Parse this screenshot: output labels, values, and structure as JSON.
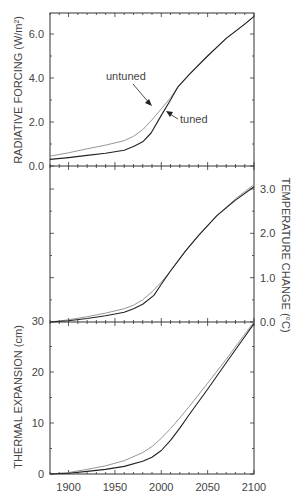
{
  "chart_data": [
    {
      "type": "line",
      "panel": "top",
      "ylabel": "RADIATIVE FORCING (W/m²)",
      "ylabel_side": "left",
      "ylim": [
        0,
        7
      ],
      "yticks": [
        0,
        2,
        4,
        6
      ],
      "ytick_labels": [
        "0.0",
        "2.0",
        "4.0",
        "6.0"
      ],
      "xlim": [
        1880,
        2100
      ],
      "annotations": [
        {
          "text": "untuned",
          "x": 1985,
          "y": 4.1,
          "arrow_to": [
            2005,
            3.1
          ]
        },
        {
          "text": "tuned",
          "x": 2033,
          "y": 2.2,
          "arrow_to": [
            2014,
            2.8
          ]
        }
      ],
      "series": [
        {
          "name": "untuned",
          "color": "#8a8a8a",
          "x": [
            1880,
            1900,
            1920,
            1940,
            1960,
            1970,
            1980,
            1990,
            2000,
            2010,
            2018,
            2030,
            2050,
            2070,
            2090,
            2100
          ],
          "y": [
            0.45,
            0.6,
            0.78,
            0.95,
            1.15,
            1.35,
            1.65,
            2.1,
            2.6,
            3.1,
            3.6,
            4.15,
            5.0,
            5.8,
            6.45,
            6.8
          ]
        },
        {
          "name": "tuned",
          "color": "#222222",
          "x": [
            1880,
            1900,
            1920,
            1940,
            1960,
            1970,
            1980,
            1989,
            2000,
            2010,
            2018,
            2030,
            2050,
            2070,
            2090,
            2100
          ],
          "y": [
            0.3,
            0.38,
            0.48,
            0.58,
            0.72,
            0.88,
            1.1,
            1.5,
            2.3,
            3.0,
            3.6,
            4.15,
            5.0,
            5.8,
            6.45,
            6.8
          ]
        }
      ]
    },
    {
      "type": "line",
      "panel": "middle",
      "ylabel": "TEMPERATURE CHANGE (°C)",
      "ylabel_side": "right",
      "ylim": [
        0,
        3.4
      ],
      "yticks": [
        0,
        1,
        2,
        3
      ],
      "ytick_labels": [
        "0.0",
        "1.0",
        "2.0",
        "3.0"
      ],
      "xlim": [
        1880,
        2100
      ],
      "series": [
        {
          "name": "untuned",
          "color": "#8a8a8a",
          "x": [
            1880,
            1900,
            1920,
            1940,
            1960,
            1970,
            1980,
            1990,
            2000,
            2010,
            2026,
            2040,
            2060,
            2080,
            2100
          ],
          "y": [
            0.0,
            0.05,
            0.12,
            0.2,
            0.3,
            0.38,
            0.5,
            0.68,
            0.9,
            1.15,
            1.6,
            1.95,
            2.4,
            2.78,
            3.1
          ]
        },
        {
          "name": "tuned",
          "color": "#222222",
          "x": [
            1880,
            1900,
            1920,
            1940,
            1960,
            1970,
            1980,
            1992,
            2000,
            2010,
            2026,
            2040,
            2060,
            2080,
            2100
          ],
          "y": [
            0.0,
            0.03,
            0.08,
            0.14,
            0.22,
            0.3,
            0.4,
            0.6,
            0.85,
            1.15,
            1.6,
            1.95,
            2.4,
            2.75,
            3.05
          ]
        }
      ]
    },
    {
      "type": "line",
      "panel": "bottom",
      "ylabel": "THERMAL EXPANSION (cm)",
      "ylabel_side": "left",
      "ylim": [
        0,
        30
      ],
      "yticks": [
        0,
        10,
        20,
        30
      ],
      "ytick_labels": [
        "0",
        "10",
        "20",
        "30"
      ],
      "xlim": [
        1880,
        2100
      ],
      "xticks": [
        1900,
        1950,
        2000,
        2050,
        2100
      ],
      "xtick_labels": [
        "1900",
        "1950",
        "2000",
        "2050",
        "2100"
      ],
      "series": [
        {
          "name": "untuned",
          "color": "#8a8a8a",
          "x": [
            1880,
            1900,
            1920,
            1940,
            1960,
            1980,
            1990,
            2000,
            2010,
            2020,
            2030,
            2050,
            2070,
            2090,
            2100
          ],
          "y": [
            0.0,
            0.3,
            0.9,
            1.6,
            2.6,
            4.2,
            5.4,
            7.0,
            8.9,
            11.0,
            13.2,
            17.8,
            22.5,
            27.4,
            29.8
          ]
        },
        {
          "name": "tuned",
          "color": "#222222",
          "x": [
            1880,
            1900,
            1920,
            1940,
            1960,
            1980,
            1990,
            2000,
            2010,
            2020,
            2030,
            2050,
            2070,
            2090,
            2100
          ],
          "y": [
            0.0,
            0.15,
            0.5,
            0.9,
            1.5,
            2.5,
            3.3,
            4.6,
            6.6,
            9.0,
            11.6,
            16.6,
            21.8,
            26.9,
            29.5
          ]
        }
      ]
    }
  ],
  "labels": {
    "top_ylabel": "RADIATIVE FORCING (W/m²)",
    "mid_ylabel": "TEMPERATURE CHANGE (°C)",
    "bot_ylabel": "THERMAL EXPANSION (cm)",
    "untuned": "untuned",
    "tuned": "tuned"
  }
}
